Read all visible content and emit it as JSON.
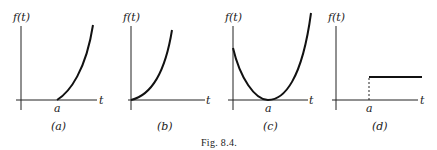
{
  "figure": {
    "caption": "Fig. 8.4.",
    "panels": [
      {
        "id": "a",
        "sublabel": "(a)",
        "ylabel": "f(t)",
        "xlabel": "t",
        "tick_label": "a",
        "description": "f(t)=0 for t<a, then increasing convex curve from a"
      },
      {
        "id": "b",
        "sublabel": "(b)",
        "ylabel": "f(t)",
        "xlabel": "t",
        "tick_label": "",
        "description": "increasing convex curve from origin"
      },
      {
        "id": "c",
        "sublabel": "(c)",
        "ylabel": "f(t)",
        "xlabel": "t",
        "tick_label": "a",
        "description": "parabola-like curve with minimum 0 at t=a"
      },
      {
        "id": "d",
        "sublabel": "(d)",
        "ylabel": "f(t)",
        "xlabel": "t",
        "tick_label": "a",
        "description": "unit step starting at t=a (dashed jump)"
      }
    ]
  }
}
